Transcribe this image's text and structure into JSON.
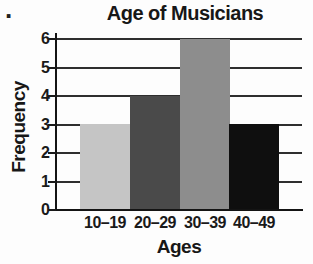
{
  "page": {
    "list_marker": "."
  },
  "chart_data": {
    "type": "bar",
    "title": "Age of Musicians",
    "xlabel": "Ages",
    "ylabel": "Frequency",
    "categories": [
      "10–19",
      "20–29",
      "30–39",
      "40–49"
    ],
    "values": [
      3,
      4,
      6,
      3
    ],
    "bar_colors": [
      "#c5c5c5",
      "#4a4a4a",
      "#8d8d8d",
      "#0f0f0f"
    ],
    "ylim": [
      0,
      6
    ],
    "yticks": [
      0,
      1,
      2,
      3,
      4,
      5,
      6
    ],
    "grid": "horizontal",
    "legend": "none",
    "axis_color": "#141414"
  }
}
